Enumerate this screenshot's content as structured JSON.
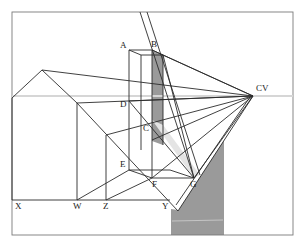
{
  "diagram": {
    "colors": {
      "line": "#2b2b2b",
      "frame": "#7a7a7a",
      "horizon": "#d6d6d6",
      "shade_dark": "#9a9a9a",
      "shade_light": "#e4e4e4",
      "background": "#ffffff"
    },
    "labels": {
      "A": "A",
      "B": "B",
      "C": "C",
      "D": "D",
      "E": "E",
      "F": "F",
      "G": "G",
      "CV": "CV",
      "X": "X",
      "W": "W",
      "Z": "Z",
      "Y": "Y"
    },
    "points": {
      "A": [
        129,
        50
      ],
      "B": [
        152,
        50
      ],
      "C": [
        150,
        133
      ],
      "D": [
        129,
        101
      ],
      "E": [
        129,
        170
      ],
      "F": [
        153,
        178
      ],
      "G": [
        194,
        178
      ],
      "CV": [
        253,
        96
      ],
      "X": [
        18,
        200
      ],
      "W": [
        77,
        200
      ],
      "Z": [
        106,
        200
      ],
      "Y": [
        170,
        200
      ]
    },
    "horizon_y": 96,
    "ground_line_y": 200
  }
}
